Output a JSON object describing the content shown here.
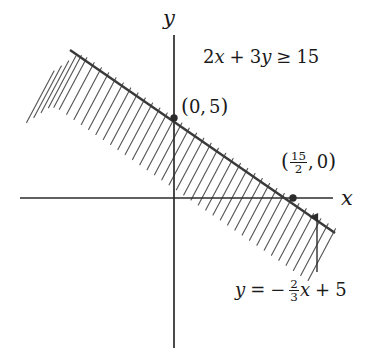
{
  "figure": {
    "type": "linear-inequality-graph",
    "background_color": "#ffffff",
    "ink_color": "#2b2b2b",
    "width": 369,
    "height": 359
  },
  "axes": {
    "x_label": "x",
    "y_label": "y",
    "origin_px": [
      174,
      198
    ],
    "x_axis_px": {
      "x1": 20,
      "x2": 333,
      "y": 198
    },
    "y_axis_px": {
      "y1": 35,
      "y2": 348,
      "x": 174
    },
    "px_per_unit_x": 15.9,
    "px_per_unit_y": 16.0
  },
  "inequality": {
    "lhs_coef_x": "2",
    "var_x": "x",
    "plus": "+",
    "lhs_coef_y": "3",
    "var_y": "y",
    "relation": "≥",
    "rhs": "15",
    "full_text": "2x + 3y ≥ 15"
  },
  "line": {
    "equation_text": "y = -2/3 x + 5",
    "eq_var": "y",
    "eq_equals": "=",
    "eq_minus": "−",
    "eq_frac_num": "2",
    "eq_frac_den": "3",
    "eq_var_x": "x",
    "eq_plus": "+",
    "eq_intercept": "5",
    "slope": -0.6667,
    "y_intercept": 5,
    "start_px": [
      70,
      50
    ],
    "end_px": [
      335,
      233
    ]
  },
  "points": [
    {
      "name": "y-intercept",
      "label_text": "(0, 5)",
      "open_paren": "(",
      "x_value": "0",
      "comma": ",",
      "y_value": "5",
      "close_paren": ")",
      "px": [
        174,
        118
      ]
    },
    {
      "name": "x-intercept",
      "label_text": "(15/2, 0)",
      "open_paren": "(",
      "frac_num": "15",
      "frac_den": "2",
      "comma": ",",
      "y_value": "0",
      "close_paren": ")",
      "px": [
        293,
        198
      ]
    }
  ],
  "shading": {
    "style": "hatched-band",
    "description": "hatch strokes above the boundary line",
    "hatch_count": 34,
    "hatch_spacing_px": 8.2,
    "hatch_angle_deg": 62,
    "hatch_length_px": 86
  },
  "pointer": {
    "name": "equation-leader-arrow",
    "from_px": [
      317,
      272
    ],
    "to_px": [
      317,
      215
    ]
  }
}
